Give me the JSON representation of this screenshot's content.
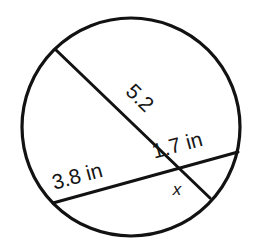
{
  "figure": {
    "background_color": "#ffffff",
    "stroke_color": "#121212",
    "text_color": "#151515"
  },
  "circle": {
    "name": "circle-outline",
    "center_x": 131,
    "center_y": 127,
    "radius": 109,
    "stroke_width": 3.2
  },
  "chords": [
    {
      "id": "chord-upper-left-to-lower-right",
      "x1": 56,
      "y1": 50,
      "x2": 210,
      "y2": 198,
      "stroke_width": 3.0
    },
    {
      "id": "chord-lower-left-to-right",
      "x1": 53,
      "y1": 203,
      "x2": 238,
      "y2": 152,
      "stroke_width": 3.0
    }
  ],
  "intersection": {
    "name": "chord-intersection-point",
    "x": 174,
    "y": 167
  },
  "labels": [
    {
      "id": "label-5-2",
      "text": "5.2",
      "x": 135,
      "y": 103,
      "rotation": 44,
      "size_class": "fig-label-size"
    },
    {
      "id": "label-3-8-in",
      "text": "3.8 in",
      "x": 79,
      "y": 183,
      "rotation": -15,
      "size_class": "fig-label-size"
    },
    {
      "id": "label-1-7-in",
      "text": "1.7 in",
      "x": 179,
      "y": 152,
      "rotation": -15,
      "size_class": "fig-label-size"
    },
    {
      "id": "label-x",
      "text": "x",
      "x": 177,
      "y": 195,
      "rotation": 0,
      "size_class": "fig-label-unknown"
    }
  ]
}
